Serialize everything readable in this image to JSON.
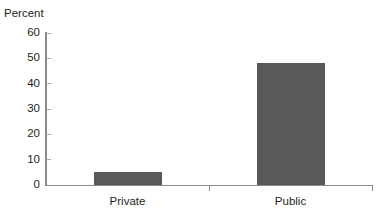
{
  "chart_data": {
    "type": "bar",
    "title": "",
    "subtitle": "",
    "xlabel": "",
    "ylabel": "Percent",
    "categories": [
      "Private",
      "Public"
    ],
    "values": [
      5,
      48
    ],
    "series": [
      {
        "name": "Percent",
        "values": [
          5,
          48
        ]
      }
    ],
    "ylim": [
      0,
      60
    ],
    "yticks": [
      0,
      10,
      20,
      30,
      40,
      50,
      60
    ],
    "ytick_labels": [
      "0",
      "10",
      "20",
      "30",
      "40",
      "50",
      "60"
    ],
    "grid": false,
    "legend": false,
    "legend_position": "none",
    "bar_color": "#595959",
    "axis_color": "#8a8a8a",
    "text_color": "#231f20",
    "background_color": "#ffffff",
    "annotations": []
  },
  "axis": {
    "y_title": "Percent"
  }
}
